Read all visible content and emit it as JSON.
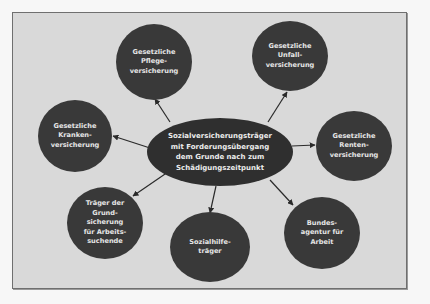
{
  "diagram": {
    "type": "hub-and-spoke",
    "colors": {
      "background": "#d9d9d9",
      "node_fill": "#393939",
      "center_fill": "#2f2f2f",
      "text": "#e6e6e6",
      "arrow": "#2a2a2a",
      "frame_border": "#6f6f6f"
    },
    "center": {
      "label": "Sozialversicherungsträger\nmit Forderungsübergang\ndem Grunde nach zum\nSchädigungszeitpunkt"
    },
    "nodes": [
      {
        "id": "pflege",
        "label": "Gesetzliche\nPflege-\nversicherung"
      },
      {
        "id": "unfall",
        "label": "Gesetzliche\nUnfall-\nversicherung"
      },
      {
        "id": "kranken",
        "label": "Gesetzliche\nKranken-\nversicherung"
      },
      {
        "id": "renten",
        "label": "Gesetzliche\nRenten-\nversicherung"
      },
      {
        "id": "grundsicherung",
        "label": "Träger der\nGrund-\nsicherung\nfür Arbeits-\nsuchende"
      },
      {
        "id": "sozialhilfe",
        "label": "Sozialhilfe-\nträger"
      },
      {
        "id": "bundesagentur",
        "label": "Bundes-\nagentur für\nArbeit"
      }
    ],
    "edges": [
      {
        "from": "center",
        "to": "pflege"
      },
      {
        "from": "center",
        "to": "unfall"
      },
      {
        "from": "center",
        "to": "kranken"
      },
      {
        "from": "center",
        "to": "renten"
      },
      {
        "from": "center",
        "to": "grundsicherung"
      },
      {
        "from": "center",
        "to": "sozialhilfe"
      },
      {
        "from": "center",
        "to": "bundesagentur"
      }
    ]
  }
}
